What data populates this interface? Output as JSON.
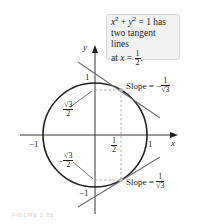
{
  "figure": {
    "callout": {
      "line1_x": "x",
      "line1_exp": "2",
      "line1_plus": " + ",
      "line1_y": "y",
      "line1_exp2": "2",
      "line1_rest": " = 1 has",
      "line2": "two tangent lines",
      "line3_prefix": "at ",
      "line3_var": "x",
      "line3_eq": " = ",
      "line3_num": "1",
      "line3_den": "2",
      "line3_end": "."
    },
    "axes": {
      "x_label": "x",
      "y_label": "y",
      "x_neg_one": "−1",
      "x_pos_one": "1",
      "y_pos_one": "1",
      "y_neg_one": "−1",
      "half_num": "1",
      "half_den": "2"
    },
    "annotations": {
      "sqrt3_over_2_num": "√3",
      "sqrt3_over_2_den": "2",
      "neg_sign": "−",
      "neg_sqrt3_over_2_num": "√3",
      "neg_sqrt3_over_2_den": "2"
    },
    "slopes": {
      "upper_prefix": "Slope = −",
      "upper_num": "1",
      "upper_den": "√3",
      "lower_prefix": "Slope = ",
      "lower_num": "1",
      "lower_den": "√3"
    },
    "caption": "FIGURE 2.36"
  },
  "colors": {
    "ink": "#231f20",
    "tangent": "#6d6e71",
    "dashed": "#9a9a9a",
    "point": "#b3b3b3",
    "callout_bg": "#f2f2f2"
  },
  "geometry": {
    "circle_center": [
      95,
      135
    ],
    "radius": 52,
    "tangent_points": [
      [
        121,
        90
      ],
      [
        121,
        180
      ]
    ]
  }
}
